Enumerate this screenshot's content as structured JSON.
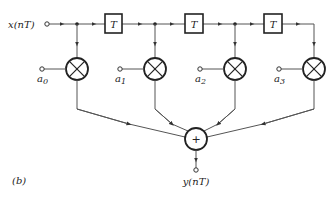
{
  "diagram": {
    "type": "FIR filter (transversal) block diagram",
    "input_label": "x(nT)",
    "output_label": "y(nT)",
    "figure_label": "(b)",
    "delay_label": "T",
    "adder_symbol": "+",
    "delays": [
      "T",
      "T",
      "T"
    ],
    "coefficients": [
      {
        "base": "a",
        "sub": "0"
      },
      {
        "base": "a",
        "sub": "1"
      },
      {
        "base": "a",
        "sub": "2"
      },
      {
        "base": "a",
        "sub": "3"
      }
    ],
    "colors": {
      "line": "#555555",
      "stroke": "#222222",
      "background": "#ffffff"
    }
  }
}
